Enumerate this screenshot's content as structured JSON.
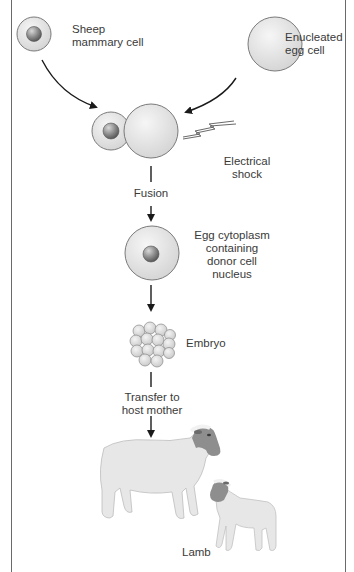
{
  "diagram": {
    "type": "process-flow",
    "topic": "cloning by nuclear transfer",
    "steps": {
      "donor_cell": {
        "label": "Sheep mammary cell",
        "line1": "Sheep",
        "line2": "mammary cell"
      },
      "egg_cell": {
        "label": "Enucleated egg cell",
        "line1": "Enucleated",
        "line2": "egg cell"
      },
      "shock": {
        "line1": "Electrical",
        "line2": "shock"
      },
      "fusion": {
        "label": "Fusion"
      },
      "fused_cell": {
        "line1": "Egg cytoplasm",
        "line2": "containing",
        "line3": "donor cell",
        "line4": "nucleus"
      },
      "embryo": {
        "label": "Embryo"
      },
      "transfer": {
        "line1": "Transfer to",
        "line2": "host mother"
      },
      "lamb": {
        "label": "Lamb"
      }
    },
    "colors": {
      "cell_fill": "#e4e4e4",
      "cell_stroke": "#7a7a7a",
      "nucleus": "#8c8c8c",
      "arrow": "#1a1a1a",
      "frame": "#6a6a6a",
      "sheep_body": "#e6e6e6",
      "sheep_face": "#8a8a8a"
    }
  }
}
